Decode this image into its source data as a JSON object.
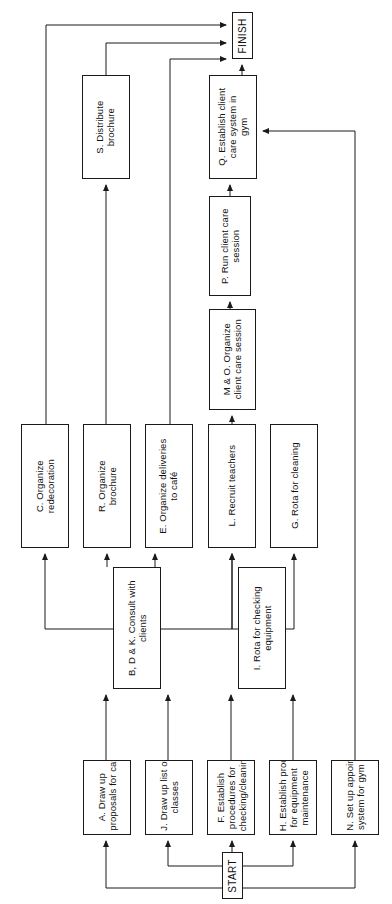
{
  "diagram": {
    "orientation": "rotated-90-ccw",
    "stroke_color": "#1a1a1a",
    "fill_color": "#ffffff",
    "terminals": {
      "start": "START",
      "finish": "FINISH"
    },
    "nodes": [
      {
        "id": "finish",
        "label": "FINISH",
        "x": 232,
        "y": 12,
        "w": 21,
        "h": 47
      },
      {
        "id": "S",
        "label": "S. Distribute\nbrochure",
        "x": 82,
        "y": 75,
        "w": 48,
        "h": 104
      },
      {
        "id": "Q",
        "label": "Q. Establish client\ncare system in\ngym",
        "x": 209,
        "y": 75,
        "w": 48,
        "h": 104
      },
      {
        "id": "P",
        "label": "P. Run client care\nsession",
        "x": 209,
        "y": 196,
        "w": 42,
        "h": 100
      },
      {
        "id": "MO",
        "label": "M & O. Organize\nclient care session",
        "x": 209,
        "y": 309,
        "w": 47,
        "h": 101
      },
      {
        "id": "C",
        "label": "C. Organize\nredecoration",
        "x": 21,
        "y": 424,
        "w": 48,
        "h": 124
      },
      {
        "id": "R",
        "label": "R. Organize\nbrochure",
        "x": 83,
        "y": 424,
        "w": 48,
        "h": 124
      },
      {
        "id": "E",
        "label": "E. Organize deliveries\nto café",
        "x": 145,
        "y": 424,
        "w": 48,
        "h": 124
      },
      {
        "id": "L",
        "label": "L. Recruit teachers",
        "x": 208,
        "y": 424,
        "w": 48,
        "h": 124
      },
      {
        "id": "G",
        "label": "G. Rota for cleaning",
        "x": 270,
        "y": 424,
        "w": 48,
        "h": 124
      },
      {
        "id": "BDK",
        "label": "B, D & K. Consult with\nclients",
        "x": 113,
        "y": 567,
        "w": 48,
        "h": 122
      },
      {
        "id": "I",
        "label": "I. Rota for checking\nequipment",
        "x": 238,
        "y": 567,
        "w": 48,
        "h": 122
      },
      {
        "id": "A",
        "label": "A. Draw up\nproposals for café etc",
        "x": 83,
        "y": 760,
        "w": 48,
        "h": 75
      },
      {
        "id": "J",
        "label": "J. Draw up list of\nclasses",
        "x": 145,
        "y": 760,
        "w": 48,
        "h": 75
      },
      {
        "id": "F",
        "label": "F. Establish\nprocedures for\nchecking/cleaning",
        "x": 207,
        "y": 760,
        "w": 48,
        "h": 75
      },
      {
        "id": "H",
        "label": "H. Establish procedures\nfor equipment\nmaintenance",
        "x": 269,
        "y": 760,
        "w": 48,
        "h": 75
      },
      {
        "id": "N",
        "label": "N. Set up appointments\nsystem for gym",
        "x": 331,
        "y": 760,
        "w": 48,
        "h": 75
      },
      {
        "id": "start",
        "label": "START",
        "x": 222,
        "y": 852,
        "w": 21,
        "h": 47
      }
    ],
    "edges": [
      {
        "id": "start-A",
        "from": "start",
        "to": "A",
        "path": "M 232 888 L 106 888 L 106 841"
      },
      {
        "id": "start-J",
        "from": "start",
        "to": "J",
        "path": "M 232 866 L 168 866 L 168 841"
      },
      {
        "id": "start-F",
        "from": "start",
        "to": "F",
        "path": "M 232 852 L 232 841"
      },
      {
        "id": "start-H",
        "from": "start",
        "to": "H",
        "path": "M 243 866 L 293 866 L 293 841"
      },
      {
        "id": "start-N",
        "from": "start",
        "to": "N",
        "path": "M 243 888 L 355 888 L 355 841"
      },
      {
        "id": "A-BDK",
        "from": "A",
        "to": "BDK",
        "path": "M 106 760 L 106 695"
      },
      {
        "id": "J-BDK",
        "from": "J",
        "to": "BDK",
        "path": "M 168 760 L 168 695"
      },
      {
        "id": "F-I",
        "from": "F",
        "to": "I",
        "path": "M 231 760 L 231 695"
      },
      {
        "id": "H-I",
        "from": "H",
        "to": "I",
        "path": "M 293 760 L 293 695"
      },
      {
        "id": "N-Q",
        "from": "N",
        "to": "Q",
        "path": "M 355 760 L 355 131 L 263 131"
      },
      {
        "id": "BDK-C",
        "from": "BDK",
        "to": "C",
        "path": "M 113 629 L 45 629 L 45 554"
      },
      {
        "id": "BDK-R",
        "from": "BDK",
        "to": "R",
        "path": "M 107 567 L 107 554"
      },
      {
        "id": "BDK-E",
        "from": "BDK",
        "to": "E",
        "path": "M 155 567 L 155 554"
      },
      {
        "id": "BDK-L",
        "from": "BDK",
        "to": "L",
        "path": "M 161 629 L 232 629 L 232 554"
      },
      {
        "id": "I-L",
        "from": "I",
        "to": "L",
        "path": "M 238 629 L 232 629 L 232 554"
      },
      {
        "id": "I-G",
        "from": "I",
        "to": "G",
        "path": "M 286 629 L 294 629 L 294 554"
      },
      {
        "id": "L-MO",
        "from": "L",
        "to": "MO",
        "path": "M 232 424 L 232 416"
      },
      {
        "id": "MO-P",
        "from": "MO",
        "to": "P",
        "path": "M 230 309 L 230 302"
      },
      {
        "id": "P-Q",
        "from": "P",
        "to": "Q",
        "path": "M 230 196 L 230 185"
      },
      {
        "id": "Q-FINISH",
        "from": "Q",
        "to": "finish",
        "path": "M 242 75 L 242 65"
      },
      {
        "id": "C-FINISH",
        "from": "C",
        "to": "finish",
        "path": "M 46 424 L 46 25 L 226 25"
      },
      {
        "id": "R-S",
        "from": "R",
        "to": "S",
        "path": "M 106 424 L 106 185"
      },
      {
        "id": "S-FINISH",
        "from": "S",
        "to": "finish",
        "path": "M 106 75 L 106 43 L 226 43"
      },
      {
        "id": "E-FINISH",
        "from": "E",
        "to": "finish",
        "path": "M 170 424 L 170 59 L 226 59"
      }
    ]
  }
}
